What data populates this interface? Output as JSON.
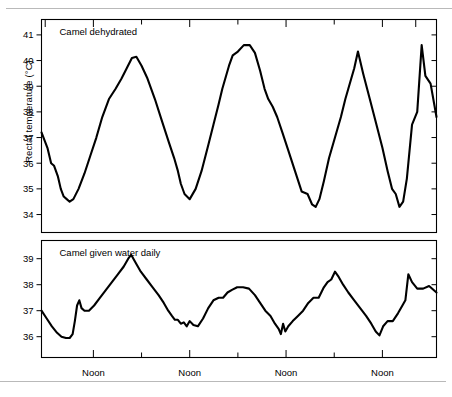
{
  "figure": {
    "ylabel": "Rectal temperature (°C)",
    "line_color": "#000000",
    "rule_color": "#b9b9b9"
  },
  "chart_data": {
    "type": "line",
    "title": "",
    "xlabel": "",
    "ylabel": "Rectal temperature (°C)",
    "grid": false,
    "legend": "none",
    "panels": [
      {
        "id": "top",
        "title": "Camel dehydrated",
        "ylim": [
          33.3,
          41.6
        ],
        "yticks": [
          34,
          35,
          36,
          37,
          38,
          39,
          40,
          41
        ],
        "ytick_labels": [
          "34",
          "35",
          "36",
          "37",
          "38",
          "39",
          "40",
          "41"
        ],
        "xlim": [
          0,
          100
        ],
        "series": [
          {
            "name": "Camel dehydrated rectal temperature",
            "x": [
              0.0,
              1.6,
              2.6,
              3.4,
              4.4,
              5.2,
              6.0,
              6.8,
              7.6,
              8.6,
              10.0,
              11.6,
              13.2,
              14.8,
              16.4,
              18.2,
              20.0,
              21.6,
              23.0,
              24.4,
              25.6,
              27.0,
              28.6,
              30.6,
              32.6,
              34.4,
              35.8,
              36.8,
              37.6,
              38.6,
              40.0,
              41.6,
              43.2,
              45.0,
              46.4,
              47.8,
              48.8,
              49.8,
              50.6,
              51.6,
              53.0,
              54.6,
              56.2,
              57.6,
              59.0,
              60.2,
              61.2,
              62.4,
              63.6,
              65.0,
              66.6,
              68.4,
              70.2,
              71.8,
              73.0,
              74.0,
              75.0,
              76.2,
              77.6,
              79.2,
              80.8,
              82.0,
              82.8,
              83.6,
              84.4,
              85.4,
              86.8,
              88.6,
              90.4,
              92.0,
              93.4,
              94.6,
              95.6,
              96.6,
              97.6,
              98.6,
              100.0
            ],
            "y": [
              37.2,
              36.6,
              36.0,
              35.9,
              35.5,
              35.0,
              34.7,
              34.6,
              34.5,
              34.6,
              35.0,
              35.6,
              36.3,
              37.0,
              37.8,
              38.5,
              38.9,
              39.3,
              39.7,
              40.1,
              40.15,
              39.8,
              39.3,
              38.5,
              37.6,
              36.8,
              36.2,
              35.7,
              35.2,
              34.8,
              34.6,
              35.0,
              35.7,
              36.7,
              37.5,
              38.3,
              38.9,
              39.4,
              39.8,
              40.2,
              40.35,
              40.6,
              40.6,
              40.3,
              39.6,
              38.9,
              38.5,
              38.2,
              37.8,
              37.2,
              36.5,
              35.7,
              34.9,
              34.8,
              34.4,
              34.3,
              34.6,
              35.3,
              36.2,
              37.0,
              37.8,
              38.5,
              38.9,
              39.3,
              39.7,
              40.35,
              39.5,
              38.5,
              37.5,
              36.6,
              35.7,
              35.0,
              34.8,
              34.3,
              34.5,
              35.4,
              37.5
            ],
            "y_max": 40.6,
            "y_min": 34.3,
            "y_start": 37.2,
            "y_end": 37.8,
            "cycles": 4,
            "peaks": [
              40.15,
              40.6,
              40.35,
              40.6
            ],
            "troughs": [
              34.5,
              34.6,
              34.3,
              34.3
            ]
          }
        ],
        "tail": {
          "x": [
            100.0,
            101.4,
            102.6,
            103.6,
            105.0,
            106.6
          ],
          "y": [
            37.5,
            38.0,
            40.6,
            39.4,
            39.1,
            37.8
          ]
        }
      },
      {
        "id": "bottom",
        "title": "Camel given water daily",
        "ylim": [
          35.2,
          39.7
        ],
        "yticks": [
          36,
          37,
          38,
          39
        ],
        "ytick_labels": [
          "36",
          "37",
          "38",
          "39"
        ],
        "xlim": [
          0,
          100
        ],
        "series": [
          {
            "name": "Camel given water daily rectal temperature",
            "x": [
              0.0,
              1.4,
              2.8,
              4.2,
              5.4,
              6.6,
              7.6,
              8.4,
              9.0,
              9.6,
              10.2,
              10.8,
              11.6,
              12.8,
              14.2,
              15.8,
              17.4,
              19.0,
              20.6,
              22.2,
              23.4,
              24.2,
              24.8,
              25.6,
              26.8,
              28.4,
              30.0,
              31.6,
              33.0,
              34.2,
              35.2,
              36.0,
              36.8,
              37.6,
              38.4,
              39.2,
              40.0,
              41.0,
              42.2,
              43.6,
              45.0,
              46.4,
              47.8,
              49.0,
              50.2,
              51.4,
              52.8,
              54.4,
              56.0,
              57.6,
              59.0,
              60.4,
              61.8,
              63.0,
              64.0,
              64.6,
              65.2,
              65.8,
              66.6,
              67.8,
              69.2,
              70.6,
              72.0,
              73.4,
              74.8,
              76.2,
              77.2,
              78.2,
              79.2,
              80.2,
              81.4,
              82.8,
              84.4,
              86.0,
              87.6,
              89.0,
              90.2,
              91.2,
              92.2,
              93.4,
              94.8,
              96.2,
              97.4,
              98.2,
              99.0,
              100.0
            ],
            "y": [
              37.0,
              36.7,
              36.4,
              36.15,
              36.0,
              35.95,
              35.95,
              36.1,
              36.6,
              37.2,
              37.4,
              37.1,
              37.0,
              37.0,
              37.2,
              37.5,
              37.8,
              38.1,
              38.4,
              38.7,
              39.0,
              39.15,
              39.0,
              38.8,
              38.5,
              38.2,
              37.9,
              37.6,
              37.3,
              37.0,
              36.8,
              36.65,
              36.65,
              36.5,
              36.55,
              36.4,
              36.6,
              36.45,
              36.4,
              36.7,
              37.1,
              37.4,
              37.5,
              37.5,
              37.7,
              37.8,
              37.9,
              37.9,
              37.85,
              37.6,
              37.3,
              37.0,
              36.8,
              36.5,
              36.3,
              36.1,
              36.5,
              36.2,
              36.4,
              36.6,
              36.8,
              37.0,
              37.3,
              37.5,
              37.5,
              37.9,
              38.1,
              38.2,
              38.5,
              38.3,
              38.0,
              37.7,
              37.4,
              37.1,
              36.8,
              36.5,
              36.2,
              36.05,
              36.4,
              36.6,
              36.6,
              36.9,
              37.2,
              37.4,
              38.4,
              38.1
            ],
            "y_max": 39.15,
            "y_min": 35.95,
            "y_start": 37.0,
            "y_end": 37.7,
            "cycles": 4,
            "peaks": [
              39.15,
              37.9,
              38.5,
              38.4
            ],
            "troughs": [
              35.95,
              36.4,
              36.05,
              36.05
            ]
          }
        ],
        "tail": {
          "x": [
            100.0,
            101.4,
            103.0,
            104.6,
            106.6
          ],
          "y": [
            38.1,
            37.85,
            37.85,
            37.95,
            37.7
          ]
        }
      }
    ],
    "x_tick_labels": [
      "Noon",
      "Noon",
      "Noon",
      "Noon"
    ],
    "x_major_tick_positions": [
      14,
      40,
      66,
      92
    ],
    "x_minor_tick_positions": [
      27,
      53,
      79
    ]
  }
}
